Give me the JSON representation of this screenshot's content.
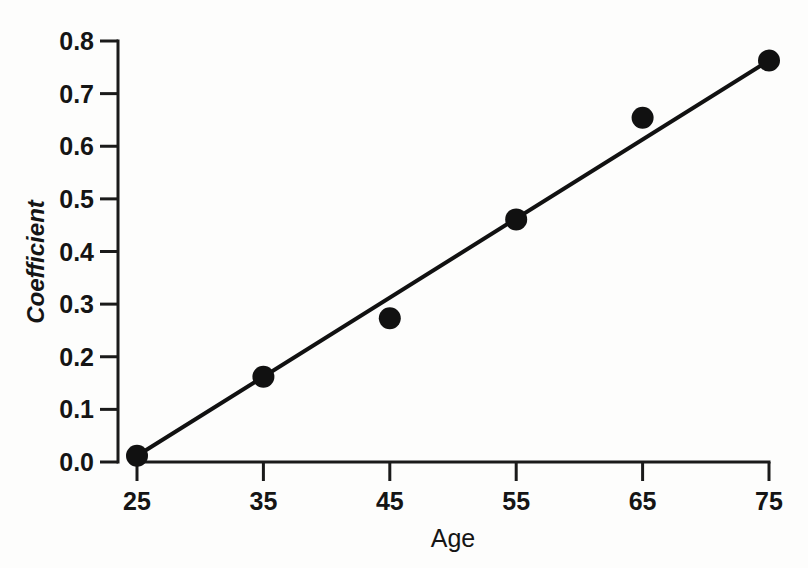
{
  "chart_data": {
    "type": "scatter",
    "title": "",
    "xlabel": "Age",
    "ylabel": "Coefficient",
    "x": [
      25,
      35,
      45,
      55,
      65,
      75
    ],
    "values": [
      0.012,
      0.162,
      0.273,
      0.461,
      0.654,
      0.763
    ],
    "series": [
      {
        "name": "Coefficient",
        "values": [
          0.012,
          0.162,
          0.273,
          0.461,
          0.654,
          0.763
        ]
      }
    ],
    "trend_line": {
      "name": "fitted line",
      "x": [
        25,
        75
      ],
      "y": [
        0.012,
        0.763
      ]
    },
    "xlim": [
      25,
      75
    ],
    "ylim": [
      0.0,
      0.8
    ],
    "xticks": [
      25,
      35,
      45,
      55,
      65,
      75
    ],
    "yticks": [
      0.0,
      0.1,
      0.2,
      0.3,
      0.4,
      0.5,
      0.6,
      0.7,
      0.8
    ],
    "xtick_labels": [
      "25",
      "35",
      "45",
      "55",
      "65",
      "75"
    ],
    "ytick_labels": [
      "0.0",
      "0.1",
      "0.2",
      "0.3",
      "0.4",
      "0.5",
      "0.6",
      "0.7",
      "0.8"
    ],
    "grid": false,
    "legend": false,
    "marker": "filled-circle",
    "marker_color": "#111111",
    "line_color": "#111111",
    "axis_color": "#1a1a1a",
    "background_color": "#fdfdfc"
  },
  "axes": {
    "y_title": "Coefficient",
    "x_title": "Age"
  }
}
